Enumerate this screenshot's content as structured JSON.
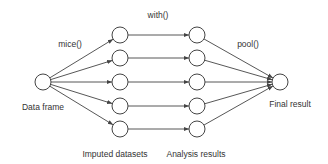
{
  "diagram": {
    "colors": {
      "stroke": "#444444",
      "node_fill": "#ffffff",
      "text": "#333333"
    },
    "steps": {
      "impute": "mice()",
      "analyze": "with()",
      "pool": "pool()"
    },
    "stage_labels": {
      "source": "Data frame",
      "imputed": "Imputed datasets",
      "analysis": "Analysis results",
      "final": "Final result"
    },
    "nodes": {
      "source": {
        "x": 43,
        "y": 82
      },
      "imputed": [
        {
          "x": 120,
          "y": 35
        },
        {
          "x": 120,
          "y": 58
        },
        {
          "x": 120,
          "y": 82
        },
        {
          "x": 120,
          "y": 106
        },
        {
          "x": 120,
          "y": 129
        }
      ],
      "analysis": [
        {
          "x": 197,
          "y": 35
        },
        {
          "x": 197,
          "y": 58
        },
        {
          "x": 197,
          "y": 82
        },
        {
          "x": 197,
          "y": 106
        },
        {
          "x": 197,
          "y": 129
        }
      ],
      "final": {
        "x": 280,
        "y": 82
      }
    },
    "node_radius": 8
  }
}
